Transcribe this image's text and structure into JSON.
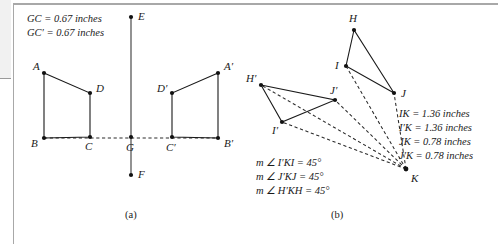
{
  "figure": {
    "captions": [
      {
        "id": "caption-a",
        "label": "(a)",
        "x": 125,
        "y": 218
      },
      {
        "id": "caption-b",
        "label": "(b)",
        "x": 331,
        "y": 218
      }
    ]
  },
  "panel_a": {
    "name": "reflection-figure",
    "measurements": [
      {
        "id": "m-gc",
        "text": "GC  = 0.67 inches",
        "x": 27,
        "y": 22
      },
      {
        "id": "m-gcp",
        "text": "GC′ = 0.67 inches",
        "x": 27,
        "y": 36
      }
    ],
    "mirror_axis": {
      "from": {
        "label": "E",
        "x": 131,
        "y": 17
      },
      "to": {
        "label": "F",
        "x": 131,
        "y": 175
      },
      "label_e": {
        "text": "E",
        "x": 138,
        "y": 20
      },
      "label_f": {
        "text": "F",
        "x": 138,
        "y": 178
      }
    },
    "points": [
      {
        "label": "A",
        "x": 44,
        "y": 73,
        "lx": 33,
        "ly": 70
      },
      {
        "label": "B",
        "x": 44,
        "y": 138,
        "lx": 31,
        "ly": 147
      },
      {
        "label": "C",
        "x": 90,
        "y": 137,
        "lx": 85,
        "ly": 150
      },
      {
        "label": "D",
        "x": 90,
        "y": 93,
        "lx": 96,
        "ly": 92
      },
      {
        "label": "G",
        "x": 131,
        "y": 137,
        "lx": 126,
        "ly": 151
      },
      {
        "label": "C′",
        "x": 172,
        "y": 137,
        "lx": 166,
        "ly": 151
      },
      {
        "label": "D′",
        "x": 172,
        "y": 93,
        "lx": 157,
        "ly": 92
      },
      {
        "label": "A′",
        "x": 218,
        "y": 73,
        "lx": 224,
        "ly": 70
      },
      {
        "label": "B′",
        "x": 218,
        "y": 138,
        "lx": 224,
        "ly": 147
      }
    ],
    "quad_left": "44,73 90,93 90,137 44,138",
    "quad_right": "218,73 172,93 172,137 218,138",
    "dashed_axis_segment": "44,138 218,138"
  },
  "panel_b": {
    "name": "rotation-figure",
    "measurements": [
      {
        "id": "m-ik",
        "text": "IK  = 1.36 inches",
        "x": 399,
        "y": 117
      },
      {
        "id": "m-ipk",
        "text": "I′K = 1.36 inches",
        "x": 399,
        "y": 131
      },
      {
        "id": "m-jk",
        "text": "JK  = 0.78 inches",
        "x": 399,
        "y": 145
      },
      {
        "id": "m-jpk",
        "text": "J′K = 0.78 inches",
        "x": 399,
        "y": 159
      }
    ],
    "angles": [
      {
        "id": "a-ipki",
        "text": "m ∠ I′KI = 45°",
        "x": 256,
        "y": 166
      },
      {
        "id": "a-jpkj",
        "text": "m ∠ J′KJ = 45°",
        "x": 256,
        "y": 180
      },
      {
        "id": "a-hpkh",
        "text": "m ∠ H′KH = 45°",
        "x": 256,
        "y": 194
      }
    ],
    "points": [
      {
        "label": "H",
        "x": 354,
        "y": 30,
        "lx": 349,
        "ly": 22
      },
      {
        "label": "I",
        "x": 346,
        "y": 66,
        "lx": 335,
        "ly": 69
      },
      {
        "label": "J",
        "x": 394,
        "y": 93,
        "lx": 401,
        "ly": 97
      },
      {
        "label": "H′",
        "x": 261,
        "y": 85,
        "lx": 246,
        "ly": 82
      },
      {
        "label": "I′",
        "x": 282,
        "y": 122,
        "lx": 272,
        "ly": 134
      },
      {
        "label": "J′",
        "x": 335,
        "y": 100,
        "lx": 330,
        "ly": 94
      },
      {
        "label": "K",
        "x": 406,
        "y": 169,
        "lx": 411,
        "ly": 182
      }
    ],
    "triangle_hij": "354,30 346,66 394,93",
    "triangle_hpipjp": "261,85 282,122 335,100",
    "rays_from_k": [
      {
        "id": "ray-k-i",
        "d": "M406,169 L346,66"
      },
      {
        "id": "ray-k-j",
        "d": "M406,169 L394,93"
      },
      {
        "id": "ray-k-ip",
        "d": "M406,169 L282,122"
      },
      {
        "id": "ray-k-jp",
        "d": "M406,169 L335,100"
      },
      {
        "id": "ray-k-hp",
        "d": "M406,169 L261,85"
      }
    ]
  }
}
